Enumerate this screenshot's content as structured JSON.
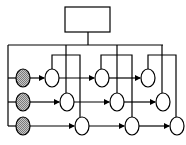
{
  "diagram": {
    "type": "network",
    "top_box": {
      "label": "",
      "x": 65,
      "y": 7,
      "w": 45,
      "h": 25
    },
    "bus": {
      "y": 45,
      "x_start": 8,
      "x_end": 163
    },
    "colors": {
      "stroke": "#000000",
      "source_fill": "#a0a0a0",
      "node_fill": "#ffffff"
    },
    "rows": [
      {
        "y": 78,
        "source_x": 23,
        "nodes_x": [
          52,
          102,
          148
        ]
      },
      {
        "y": 102,
        "source_x": 23,
        "nodes_x": [
          67,
          117,
          163
        ]
      },
      {
        "y": 126,
        "source_x": 23,
        "nodes_x": [
          82,
          132,
          177
        ]
      }
    ],
    "node_count": 9,
    "source_count": 3
  }
}
